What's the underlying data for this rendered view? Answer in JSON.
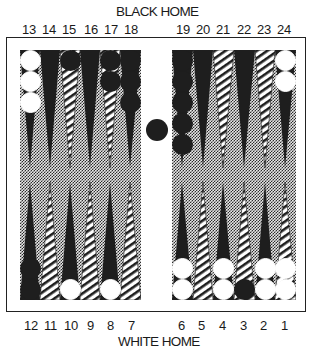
{
  "labels": {
    "top_home": "BLACK HOME",
    "bottom_home": "WHITE HOME"
  },
  "top_numbers": [
    "13",
    "14",
    "15",
    "16",
    "17",
    "18",
    "19",
    "20",
    "21",
    "22",
    "23",
    "24"
  ],
  "bottom_numbers": [
    "12",
    "11",
    "10",
    "9",
    "8",
    "7",
    "6",
    "5",
    "4",
    "3",
    "2",
    "1"
  ],
  "colors": {
    "frame": "#222222",
    "dark_point": "#1e1e1e",
    "light_point": "hatched",
    "board_texture": "checkered-gray",
    "black_checker": "#1e1e1e",
    "white_checker": "#ffffff"
  },
  "position": {
    "points": [
      {
        "point": 1,
        "color": "white",
        "count": 2
      },
      {
        "point": 2,
        "color": "white",
        "count": 2
      },
      {
        "point": 3,
        "color": "black",
        "count": 1
      },
      {
        "point": 4,
        "color": "white",
        "count": 2
      },
      {
        "point": 5,
        "color": null,
        "count": 0
      },
      {
        "point": 6,
        "color": "white",
        "count": 2
      },
      {
        "point": 7,
        "color": null,
        "count": 0
      },
      {
        "point": 8,
        "color": "white",
        "count": 1
      },
      {
        "point": 9,
        "color": null,
        "count": 0
      },
      {
        "point": 10,
        "color": "white",
        "count": 1
      },
      {
        "point": 11,
        "color": null,
        "count": 0
      },
      {
        "point": 12,
        "color": "black",
        "count": 2
      },
      {
        "point": 13,
        "color": "white",
        "count": 3
      },
      {
        "point": 14,
        "color": null,
        "count": 0
      },
      {
        "point": 15,
        "color": "black",
        "count": 1
      },
      {
        "point": 16,
        "color": null,
        "count": 0
      },
      {
        "point": 17,
        "color": "black",
        "count": 2
      },
      {
        "point": 18,
        "color": "black",
        "count": 3
      },
      {
        "point": 19,
        "color": "black",
        "count": 5
      },
      {
        "point": 20,
        "color": null,
        "count": 0
      },
      {
        "point": 21,
        "color": null,
        "count": 0
      },
      {
        "point": 22,
        "color": null,
        "count": 0
      },
      {
        "point": 23,
        "color": null,
        "count": 0
      },
      {
        "point": 24,
        "color": "white",
        "count": 2
      }
    ],
    "bar": {
      "black": 1,
      "white": 0
    }
  }
}
